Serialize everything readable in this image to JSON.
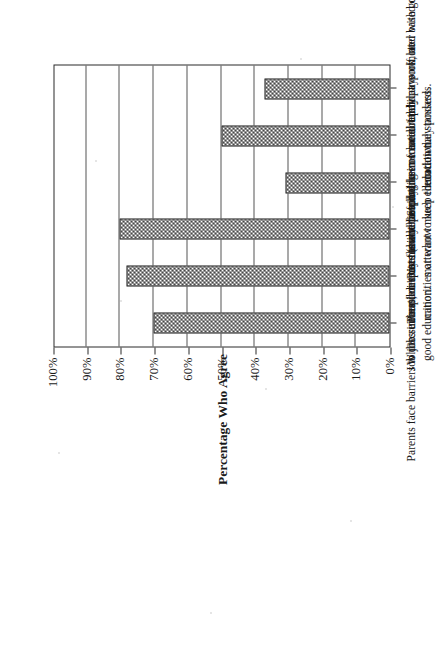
{
  "chart_data": {
    "type": "bar",
    "orientation": "vertical-printed-rotated",
    "title": "",
    "xlabel": "",
    "ylabel": "Percentage Who Agree",
    "ylim": [
      0,
      100
    ],
    "ytick_labels": [
      "0%",
      "10%",
      "20%",
      "30%",
      "40%",
      "50%",
      "60%",
      "70%",
      "80%",
      "90%",
      "100%"
    ],
    "ytick_values": [
      0,
      10,
      20,
      30,
      40,
      50,
      60,
      70,
      80,
      90,
      100
    ],
    "grid": true,
    "legend": "none",
    "categories": [
      "Parents face barriers to job success, despite their belief in a good education.",
      "Job discrimination exists (some to a lot).",
      "Whites either don't care about the progress of racial/ethnic minorities or want to keep them down.",
      "People in my family have not been treated fairly at work, no matterhow much education they possess.",
      "Parents and people like me are not paid or promoted based on educational standards.",
      "Studying in school rarely pays off later with good jobs."
    ],
    "values": [
      70,
      78,
      80,
      31,
      50,
      37
    ],
    "series": [
      {
        "name": "Percentage Who Agree",
        "values": [
          70,
          78,
          80,
          31,
          50,
          37
        ]
      }
    ]
  },
  "axis": {
    "y_title": "Percentage Who Agree"
  }
}
